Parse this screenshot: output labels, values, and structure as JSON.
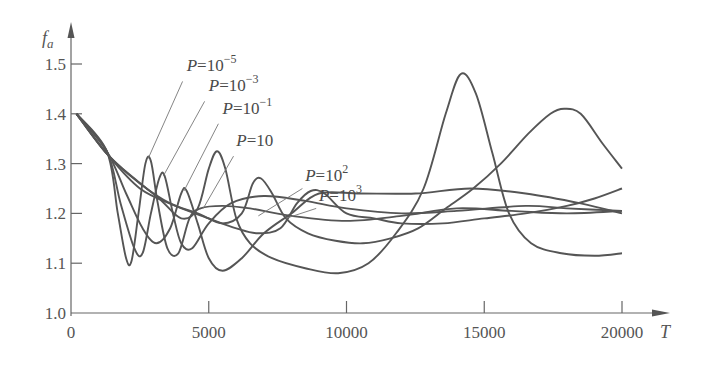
{
  "chart_data": {
    "type": "line",
    "title": "",
    "xlabel": "T",
    "ylabel": "f_a",
    "xlim": [
      0,
      21500
    ],
    "ylim": [
      1.0,
      1.55
    ],
    "grid": false,
    "x_ticks": [
      0,
      5000,
      10000,
      15000,
      20000
    ],
    "x_tick_labels": [
      "0",
      "5000",
      "10000",
      "15000",
      "20000"
    ],
    "y_ticks": [
      1.0,
      1.1,
      1.2,
      1.3,
      1.4,
      1.5
    ],
    "y_tick_labels": [
      "1.0",
      "1.1",
      "1.2",
      "1.3",
      "1.4",
      "1.5"
    ],
    "legend_position": "inline-annotations",
    "series": [
      {
        "name": "P=10^-5",
        "base": "P=10",
        "exp": "-5",
        "label_pos": [
          4200,
          1.485
        ],
        "leader": [
          [
            4050,
            1.465
          ],
          [
            2800,
            1.31
          ]
        ],
        "points": [
          [
            200,
            1.4
          ],
          [
            1300,
            1.325
          ],
          [
            1700,
            1.2
          ],
          [
            2000,
            1.11
          ],
          [
            2200,
            1.105
          ],
          [
            2450,
            1.2
          ],
          [
            2700,
            1.3
          ],
          [
            2900,
            1.305
          ],
          [
            3150,
            1.22
          ],
          [
            3500,
            1.13
          ],
          [
            3900,
            1.12
          ],
          [
            4300,
            1.19
          ],
          [
            4700,
            1.21
          ],
          [
            5500,
            1.215
          ],
          [
            6500,
            1.21
          ],
          [
            8000,
            1.195
          ],
          [
            10000,
            1.185
          ],
          [
            12000,
            1.195
          ],
          [
            14000,
            1.21
          ],
          [
            16000,
            1.205
          ],
          [
            18000,
            1.2
          ],
          [
            20000,
            1.205
          ]
        ]
      },
      {
        "name": "P=10^-3",
        "base": "P=10",
        "exp": "-3",
        "label_pos": [
          5000,
          1.445
        ],
        "leader": [
          [
            4850,
            1.425
          ],
          [
            3350,
            1.275
          ]
        ],
        "points": [
          [
            200,
            1.4
          ],
          [
            1300,
            1.325
          ],
          [
            1800,
            1.22
          ],
          [
            2300,
            1.13
          ],
          [
            2600,
            1.12
          ],
          [
            2900,
            1.2
          ],
          [
            3200,
            1.27
          ],
          [
            3400,
            1.275
          ],
          [
            3700,
            1.2
          ],
          [
            4000,
            1.14
          ],
          [
            4400,
            1.13
          ],
          [
            5000,
            1.18
          ],
          [
            5800,
            1.22
          ],
          [
            7000,
            1.235
          ],
          [
            8500,
            1.225
          ],
          [
            10000,
            1.21
          ],
          [
            12000,
            1.2
          ],
          [
            14000,
            1.205
          ],
          [
            16500,
            1.215
          ],
          [
            18000,
            1.21
          ],
          [
            20000,
            1.205
          ]
        ]
      },
      {
        "name": "P=10^-1",
        "base": "P=10",
        "exp": "-1",
        "label_pos": [
          5500,
          1.4
        ],
        "leader": [
          [
            5350,
            1.38
          ],
          [
            4100,
            1.245
          ]
        ],
        "points": [
          [
            200,
            1.4
          ],
          [
            1300,
            1.325
          ],
          [
            2000,
            1.24
          ],
          [
            2600,
            1.17
          ],
          [
            3100,
            1.14
          ],
          [
            3600,
            1.17
          ],
          [
            4000,
            1.24
          ],
          [
            4200,
            1.245
          ],
          [
            4600,
            1.18
          ],
          [
            5000,
            1.11
          ],
          [
            5500,
            1.085
          ],
          [
            6200,
            1.11
          ],
          [
            7000,
            1.16
          ],
          [
            8000,
            1.2
          ],
          [
            9000,
            1.24
          ],
          [
            10500,
            1.24
          ],
          [
            12500,
            1.24
          ],
          [
            14500,
            1.25
          ],
          [
            16500,
            1.24
          ],
          [
            18500,
            1.22
          ],
          [
            20000,
            1.2
          ]
        ]
      },
      {
        "name": "P=10",
        "base": "P=10",
        "exp": "",
        "label_pos": [
          6000,
          1.335
        ],
        "leader": [
          [
            5900,
            1.315
          ],
          [
            4800,
            1.21
          ]
        ],
        "points": [
          [
            200,
            1.4
          ],
          [
            1300,
            1.32
          ],
          [
            2300,
            1.27
          ],
          [
            3200,
            1.23
          ],
          [
            4000,
            1.19
          ],
          [
            4600,
            1.21
          ],
          [
            5000,
            1.29
          ],
          [
            5300,
            1.325
          ],
          [
            5600,
            1.29
          ],
          [
            6000,
            1.19
          ],
          [
            6500,
            1.14
          ],
          [
            7300,
            1.11
          ],
          [
            8500,
            1.09
          ],
          [
            9700,
            1.08
          ],
          [
            10800,
            1.1
          ],
          [
            11800,
            1.16
          ],
          [
            12800,
            1.25
          ],
          [
            13600,
            1.4
          ],
          [
            14150,
            1.48
          ],
          [
            14700,
            1.44
          ],
          [
            15300,
            1.32
          ],
          [
            15900,
            1.2
          ],
          [
            16700,
            1.14
          ],
          [
            17800,
            1.12
          ],
          [
            19000,
            1.115
          ],
          [
            20000,
            1.12
          ]
        ]
      },
      {
        "name": "P=10^2",
        "base": "P=10",
        "exp": "2",
        "label_pos": [
          8500,
          1.265
        ],
        "leader": [
          [
            8400,
            1.25
          ],
          [
            6800,
            1.195
          ]
        ],
        "points": [
          [
            200,
            1.4
          ],
          [
            1300,
            1.32
          ],
          [
            2500,
            1.26
          ],
          [
            3600,
            1.22
          ],
          [
            4600,
            1.2
          ],
          [
            5500,
            1.18
          ],
          [
            6200,
            1.2
          ],
          [
            6600,
            1.26
          ],
          [
            6900,
            1.27
          ],
          [
            7300,
            1.24
          ],
          [
            7800,
            1.19
          ],
          [
            8600,
            1.16
          ],
          [
            9600,
            1.145
          ],
          [
            10600,
            1.14
          ],
          [
            11600,
            1.15
          ],
          [
            12600,
            1.17
          ],
          [
            13600,
            1.21
          ],
          [
            14600,
            1.25
          ],
          [
            15600,
            1.3
          ],
          [
            16600,
            1.36
          ],
          [
            17400,
            1.4
          ],
          [
            17900,
            1.41
          ],
          [
            18500,
            1.4
          ],
          [
            19300,
            1.34
          ],
          [
            20000,
            1.29
          ]
        ]
      },
      {
        "name": "P=10^3",
        "base": "P=10",
        "exp": "3",
        "label_pos": [
          9000,
          1.225
        ],
        "leader": [
          [
            8900,
            1.21
          ],
          [
            7800,
            1.19
          ]
        ],
        "points": [
          [
            200,
            1.4
          ],
          [
            1300,
            1.32
          ],
          [
            2500,
            1.25
          ],
          [
            3800,
            1.215
          ],
          [
            5000,
            1.19
          ],
          [
            6000,
            1.17
          ],
          [
            6800,
            1.16
          ],
          [
            7600,
            1.17
          ],
          [
            8200,
            1.22
          ],
          [
            8700,
            1.245
          ],
          [
            9200,
            1.24
          ],
          [
            10000,
            1.2
          ],
          [
            11000,
            1.19
          ],
          [
            12000,
            1.18
          ],
          [
            13500,
            1.18
          ],
          [
            15000,
            1.19
          ],
          [
            16500,
            1.2
          ],
          [
            18000,
            1.215
          ],
          [
            19000,
            1.23
          ],
          [
            20000,
            1.25
          ]
        ]
      }
    ]
  }
}
